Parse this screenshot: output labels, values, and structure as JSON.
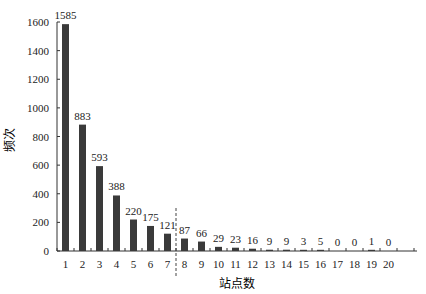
{
  "chart_data": {
    "type": "bar",
    "title": "",
    "xlabel": "站点数",
    "ylabel": "频次",
    "categories": [
      "1",
      "2",
      "3",
      "4",
      "5",
      "6",
      "7",
      "8",
      "9",
      "10",
      "11",
      "12",
      "13",
      "14",
      "15",
      "16",
      "17",
      "18",
      "19",
      "20"
    ],
    "values": [
      1585,
      883,
      593,
      388,
      220,
      175,
      121,
      87,
      66,
      29,
      23,
      16,
      9,
      9,
      3,
      5,
      0,
      0,
      1,
      0
    ],
    "ylim": [
      0,
      1600
    ],
    "yticks": [
      0,
      200,
      400,
      600,
      800,
      1000,
      1200,
      1400,
      1600
    ],
    "grid": false,
    "legend": null,
    "bar_color": "#3a3a3a",
    "annotations": [
      {
        "type": "dashed-vertical-line",
        "between": [
          "7",
          "8"
        ]
      }
    ]
  }
}
